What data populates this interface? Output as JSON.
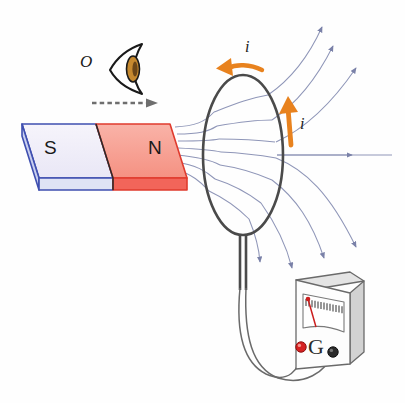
{
  "figure": {
    "background": "#fefefe"
  },
  "observer": {
    "label": "O",
    "icon": "eye-icon",
    "iris_color": "#c6892f",
    "outline_color": "#1a1a1a"
  },
  "motion_arrow": {
    "name": "motion-direction-arrow",
    "style": "dashed",
    "direction": "right",
    "color": "#6e6e6e"
  },
  "magnet": {
    "south": {
      "label": "S",
      "fill": "#f0eef8",
      "side_fill": "#c9cfef",
      "stroke": "#3f4fb0"
    },
    "north": {
      "label": "N",
      "fill": "#f7a79b",
      "side_fill": "#f2655a",
      "stroke": "#e03b2e"
    }
  },
  "coil": {
    "name": "wire-loop",
    "stroke": "#4a4a4a",
    "leads": "twin-lead-wires"
  },
  "current": {
    "label": "i",
    "color": "#e8821e",
    "arrows": [
      {
        "name": "current-arrow-top",
        "label": "i",
        "direction": "leftward-along-top"
      },
      {
        "name": "current-arrow-right",
        "label": "i",
        "direction": "upward-along-right"
      }
    ]
  },
  "field_lines": {
    "name": "magnetic-field-lines",
    "color": "#8f96b8",
    "arrowhead_color": "#7a81a8",
    "description": "Field lines emerge from N pole, pass through the loop and fan outward to the right"
  },
  "galvanometer": {
    "label": "G",
    "name": "galvanometer",
    "body_fill": "#fdfdfd",
    "top_fill": "#e4e4e4",
    "side_fill": "#d2d2d2",
    "stroke": "#6a6a6a",
    "needle_color": "#cc1f1f",
    "needle_deflection": "left-of-center",
    "scale_ticks": 14,
    "terminals": [
      {
        "name": "terminal-positive",
        "color": "#d62222"
      },
      {
        "name": "terminal-negative",
        "color": "#2b2b2b"
      }
    ]
  }
}
